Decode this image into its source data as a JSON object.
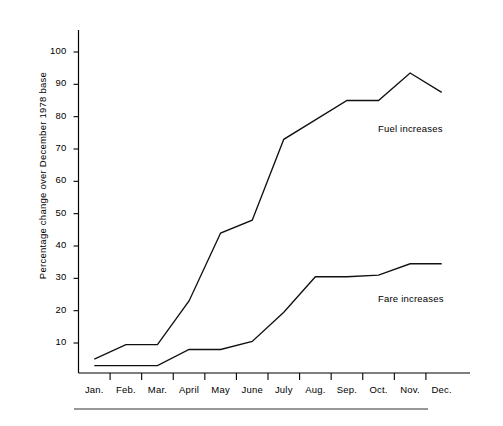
{
  "chart_data": {
    "type": "line",
    "title": "",
    "xlabel": "",
    "ylabel": "Percentage change over December 1978 base",
    "categories": [
      "Jan.",
      "Feb.",
      "Mar.",
      "April",
      "May",
      "June",
      "July",
      "Aug.",
      "Sep.",
      "Oct.",
      "Nov.",
      "Dec."
    ],
    "ytick_labels": [
      "10",
      "20",
      "30",
      "40",
      "50",
      "60",
      "70",
      "80",
      "90",
      "100"
    ],
    "yticks": [
      10,
      20,
      30,
      40,
      50,
      60,
      70,
      80,
      90,
      100
    ],
    "ylim": [
      0,
      107
    ],
    "xlim": [
      0,
      12
    ],
    "grid": false,
    "legend_position": "inline-right",
    "series": [
      {
        "name": "Fuel increases",
        "values": [
          5,
          9.5,
          9.5,
          23,
          44,
          48,
          73,
          79,
          85,
          85,
          93.5,
          87.5
        ]
      },
      {
        "name": "Fare increases",
        "values": [
          3,
          3,
          3,
          8,
          8,
          10.5,
          19.5,
          30.5,
          30.5,
          31,
          34.5,
          34.5
        ]
      }
    ],
    "annotations": [
      {
        "text": "Fuel increases",
        "series": "Fuel increases"
      },
      {
        "text": "Fare increases",
        "series": "Fare increases"
      }
    ]
  }
}
